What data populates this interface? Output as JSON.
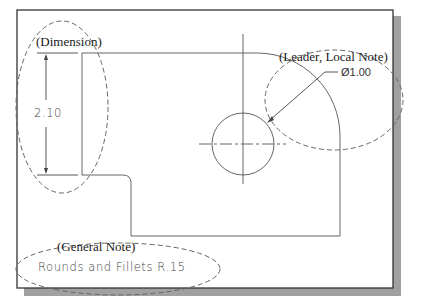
{
  "figure": {
    "type": "engineering-drawing-annotations",
    "labels": {
      "dimension": "(Dimension)",
      "leader_local_note": "(Leader, Local Note)",
      "general_note": "(General Note)"
    },
    "annotations": {
      "dimension_value": "2.10",
      "diameter_callout": "Ø1.00",
      "general_note_text": "Rounds and Fillets R.15"
    },
    "colors": {
      "frame": "#333333",
      "shadow": "#9a9a9a",
      "geometry": "#555555",
      "dashed_callouts": "#666666"
    }
  }
}
